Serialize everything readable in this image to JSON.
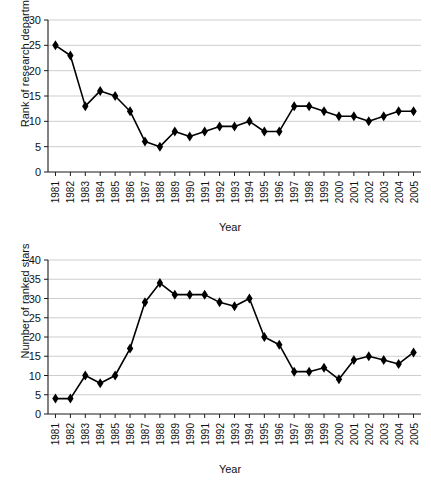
{
  "chart_data": [
    {
      "id": "rank-of-research-department",
      "type": "line",
      "title": "",
      "xlabel": "Year",
      "ylabel": "Rank of research department",
      "categories": [
        "1981",
        "1982",
        "1983",
        "1984",
        "1985",
        "1986",
        "1987",
        "1988",
        "1989",
        "1990",
        "1991",
        "1992",
        "1993",
        "1994",
        "1995",
        "1996",
        "1997",
        "1998",
        "1999",
        "2000",
        "2001",
        "2002",
        "2003",
        "2004",
        "2005"
      ],
      "values": [
        25,
        23,
        13,
        16,
        15,
        12,
        6,
        5,
        8,
        7,
        8,
        9,
        9,
        10,
        8,
        8,
        13,
        13,
        12,
        11,
        11,
        10,
        11,
        12,
        12
      ],
      "ylim": [
        0,
        30
      ],
      "yticks": [
        0,
        5,
        10,
        15,
        20,
        25,
        30
      ],
      "xtick_labels": [
        "1981",
        "1982",
        "1983",
        "1984",
        "1985",
        "1986",
        "1987",
        "1988",
        "1989",
        "1990",
        "1991",
        "1992",
        "1993",
        "1994",
        "1995",
        "1996",
        "1997",
        "1998",
        "1999",
        "2000",
        "2001",
        "2002",
        "2003",
        "2004",
        "2005"
      ],
      "grid": true,
      "legend": "none",
      "marker": "diamond",
      "line_color": "#000000",
      "grid_color": "#b9b9b9"
    },
    {
      "id": "number-of-ranked-stars",
      "type": "line",
      "title": "",
      "xlabel": "Year",
      "ylabel": "Number of ranked stars",
      "categories": [
        "1981",
        "1982",
        "1983",
        "1984",
        "1985",
        "1986",
        "1987",
        "1988",
        "1989",
        "1990",
        "1991",
        "1992",
        "1993",
        "1994",
        "1995",
        "1996",
        "1997",
        "1998",
        "1999",
        "2000",
        "2001",
        "2002",
        "2003",
        "2004",
        "2005"
      ],
      "values": [
        4,
        4,
        10,
        8,
        10,
        17,
        29,
        34,
        31,
        31,
        31,
        29,
        28,
        30,
        20,
        18,
        11,
        11,
        12,
        9,
        14,
        15,
        14,
        13,
        16
      ],
      "ylim": [
        0,
        40
      ],
      "yticks": [
        0,
        5,
        10,
        15,
        20,
        25,
        30,
        35,
        40
      ],
      "xtick_labels": [
        "1981",
        "1982",
        "1983",
        "1984",
        "1985",
        "1986",
        "1987",
        "1988",
        "1989",
        "1990",
        "1991",
        "1992",
        "1993",
        "1994",
        "1995",
        "1996",
        "1997",
        "1998",
        "1999",
        "2000",
        "2001",
        "2002",
        "2003",
        "2004",
        "2005"
      ],
      "grid": true,
      "legend": "none",
      "marker": "diamond",
      "line_color": "#000000",
      "grid_color": "#b9b9b9"
    }
  ]
}
